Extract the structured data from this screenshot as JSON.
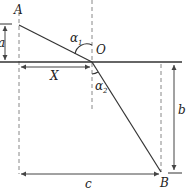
{
  "diagram": {
    "type": "refraction-geometry",
    "points": {
      "A": "A",
      "O": "O",
      "B": "B"
    },
    "angles": {
      "alpha1": {
        "symbol": "α",
        "sub": "1"
      },
      "alpha2": {
        "symbol": "α",
        "sub": "2"
      }
    },
    "dimensions": {
      "a": "a",
      "X": "X",
      "b": "b",
      "c": "c"
    },
    "colors": {
      "line": "#333333",
      "dashed": "#888888"
    }
  }
}
